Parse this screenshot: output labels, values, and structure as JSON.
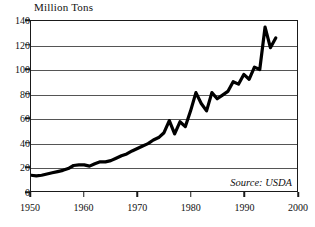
{
  "chart_data": {
    "type": "line",
    "title": "Million Tons",
    "xlabel": "",
    "ylabel": "Million Tons",
    "xlim": [
      1950,
      2000
    ],
    "ylim": [
      0,
      140
    ],
    "grid": true,
    "legend": null,
    "annotations": [
      {
        "text": "Source: USDA",
        "position": "bottom-right-inside"
      }
    ],
    "ytick_labels": [
      "0",
      "20",
      "40",
      "60",
      "80",
      "100",
      "120",
      "140"
    ],
    "ytick_values": [
      0,
      20,
      40,
      60,
      80,
      100,
      120,
      140
    ],
    "xtick_labels": [
      "1950",
      "1960",
      "1970",
      "1980",
      "1990",
      "2000"
    ],
    "xtick_values": [
      1950,
      1960,
      1970,
      1980,
      1990,
      2000
    ],
    "line_color": "#000000",
    "line_width": 3,
    "x": [
      1950,
      1951,
      1952,
      1953,
      1954,
      1955,
      1956,
      1957,
      1958,
      1959,
      1960,
      1961,
      1962,
      1963,
      1964,
      1965,
      1966,
      1967,
      1968,
      1969,
      1970,
      1971,
      1972,
      1973,
      1974,
      1975,
      1976,
      1977,
      1978,
      1979,
      1980,
      1981,
      1982,
      1983,
      1984,
      1985,
      1986,
      1987,
      1988,
      1989,
      1990,
      1991,
      1992,
      1993,
      1994,
      1995,
      1996
    ],
    "values": [
      13,
      12.5,
      13,
      14,
      15,
      16,
      17,
      18.5,
      21,
      21.5,
      21.5,
      20.5,
      22.5,
      24,
      24,
      25,
      27,
      29,
      30.5,
      33,
      35,
      37,
      39,
      42,
      44,
      48,
      58,
      47,
      57,
      53,
      66,
      81,
      72,
      66,
      81,
      76,
      79,
      82,
      90,
      88,
      96,
      92,
      102,
      100,
      135,
      118,
      126
    ],
    "series": [
      {
        "name": "Million Tons",
        "values": [
          13,
          12.5,
          13,
          14,
          15,
          16,
          17,
          18.5,
          21,
          21.5,
          21.5,
          20.5,
          22.5,
          24,
          24,
          25,
          27,
          29,
          30.5,
          33,
          35,
          37,
          39,
          42,
          44,
          48,
          58,
          47,
          57,
          53,
          66,
          81,
          72,
          66,
          81,
          76,
          79,
          82,
          90,
          88,
          96,
          92,
          102,
          100,
          135,
          118,
          126
        ]
      }
    ]
  }
}
